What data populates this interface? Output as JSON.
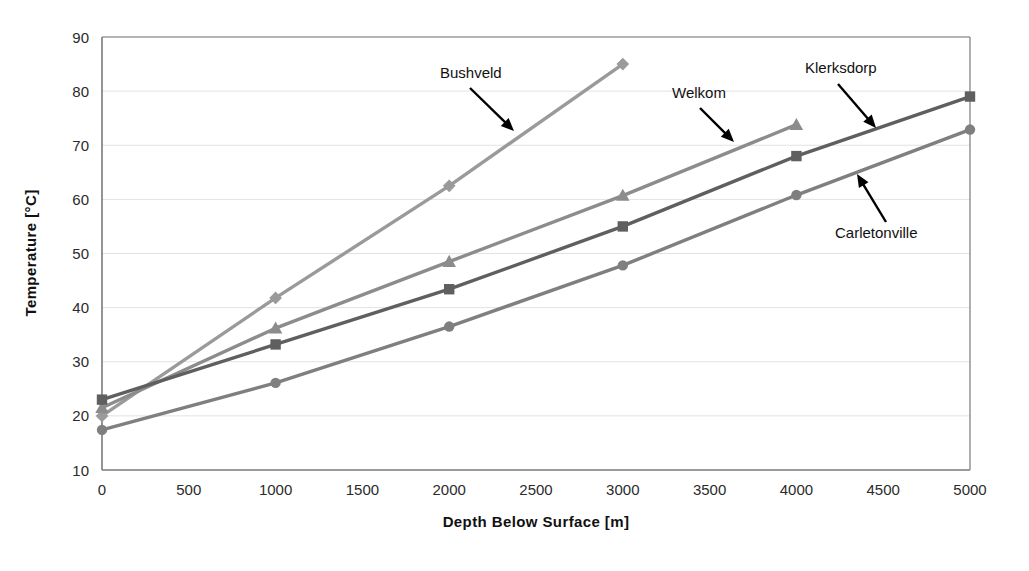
{
  "chart_data": {
    "type": "line",
    "title": "",
    "xlabel": "Depth Below Surface [m]",
    "ylabel": "Temperature [°C]",
    "xlim": [
      0,
      5000
    ],
    "ylim": [
      10,
      90
    ],
    "xticks": [
      0,
      500,
      1000,
      1500,
      2000,
      2500,
      3000,
      3500,
      4000,
      4500,
      5000
    ],
    "yticks": [
      10,
      20,
      30,
      40,
      50,
      60,
      70,
      80,
      90
    ],
    "grid": "horizontal",
    "legend_position": "inline-annotations",
    "series": [
      {
        "name": "Bushveld",
        "marker": "diamond",
        "color": "#9a9a9a",
        "x": [
          0,
          1000,
          2000,
          3000
        ],
        "values": [
          20.0,
          41.8,
          62.5,
          85.0
        ]
      },
      {
        "name": "Welkom",
        "marker": "triangle",
        "color": "#8c8c8c",
        "x": [
          0,
          1000,
          2000,
          3000,
          4000
        ],
        "values": [
          21.5,
          36.2,
          48.5,
          60.7,
          73.8
        ]
      },
      {
        "name": "Klerksdorp",
        "marker": "square",
        "color": "#5f5f5f",
        "x": [
          0,
          1000,
          2000,
          3000,
          4000,
          5000
        ],
        "values": [
          23.0,
          33.2,
          43.4,
          55.0,
          68.0,
          79.0
        ]
      },
      {
        "name": "Carletonville",
        "marker": "circle",
        "color": "#7f7f7f",
        "x": [
          0,
          1000,
          2000,
          3000,
          4000,
          5000
        ],
        "values": [
          17.4,
          26.1,
          36.5,
          47.8,
          60.8,
          72.9
        ]
      }
    ],
    "annotations": [
      {
        "text": "Bushveld",
        "label_x": 440,
        "label_y": 78,
        "arrow_x1": 470,
        "arrow_y1": 88,
        "arrow_x2": 514,
        "arrow_y2": 131
      },
      {
        "text": "Welkom",
        "label_x": 672,
        "label_y": 98,
        "arrow_x1": 700,
        "arrow_y1": 108,
        "arrow_x2": 734,
        "arrow_y2": 142
      },
      {
        "text": "Klerksdorp",
        "label_x": 805,
        "label_y": 73,
        "arrow_x1": 838,
        "arrow_y1": 84,
        "arrow_x2": 876,
        "arrow_y2": 128
      },
      {
        "text": "Carletonville",
        "label_x": 835,
        "label_y": 238,
        "arrow_x1": 886,
        "arrow_y1": 222,
        "arrow_x2": 857,
        "arrow_y2": 174
      }
    ]
  },
  "plot_geometry": {
    "left": 102,
    "right": 970,
    "top": 37,
    "bottom": 470
  },
  "colors": {
    "axis": "#7a7a7a",
    "grid": "#e2e2e6",
    "text": "#1a1a1a",
    "arrow": "#000000",
    "background": "#ffffff"
  }
}
